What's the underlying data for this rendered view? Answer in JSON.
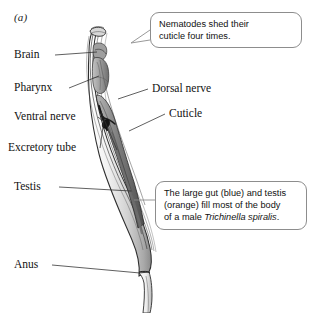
{
  "figure": {
    "panel_letter": "(a)"
  },
  "labels": {
    "brain": "Brain",
    "pharynx": "Pharynx",
    "ventral_nerve": "Ventral nerve",
    "excretory_tube": "Excretory tube",
    "testis": "Testis",
    "anus": "Anus",
    "dorsal_nerve": "Dorsal nerve",
    "cuticle": "Cuticle"
  },
  "callouts": {
    "cuticle_note": {
      "line1": "Nematodes shed their",
      "line2": "cuticle four times."
    },
    "gut_testis_note": {
      "line1": "The large gut (blue) and testis",
      "line2": "(orange) fill most of the body",
      "line3_prefix": "of a male ",
      "line3_species": "Trichinella spiralis",
      "line3_suffix": "."
    }
  },
  "colors": {
    "ink": "#121212",
    "leader_line": "#2b2b2b",
    "callout_border": "#8d8d8d",
    "background": "#ffffff",
    "organ_shade_dark": "#585858",
    "organ_shade_mid": "#9a9a9a",
    "organ_shade_light": "#c8c8c8"
  }
}
